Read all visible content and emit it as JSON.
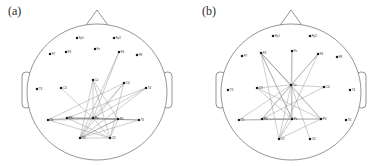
{
  "figure": {
    "background_color": "#ffffff",
    "outline_color": "#7a7a7a",
    "edge_color": "#909090",
    "node_color": "#1c1c1c"
  },
  "panels": [
    {
      "id": "a",
      "label": "(a)",
      "head": {
        "center_x": 97,
        "center_y": 92,
        "radius_x": 70,
        "radius_y": 68,
        "nose": [
          [
            84,
            28
          ],
          [
            97,
            10
          ],
          [
            110,
            28
          ]
        ],
        "ear_left": {
          "x": 22,
          "y": 72,
          "w": 9,
          "h": 36,
          "r": 4
        },
        "ear_right": {
          "x": 163,
          "y": 72,
          "w": 9,
          "h": 36,
          "r": 4
        }
      },
      "electrodes": [
        {
          "name": "Fp1",
          "x": 77,
          "y": 38
        },
        {
          "name": "Fp2",
          "x": 114,
          "y": 38
        },
        {
          "name": "F7",
          "x": 50,
          "y": 54
        },
        {
          "name": "F3",
          "x": 66,
          "y": 52
        },
        {
          "name": "Fz",
          "x": 95,
          "y": 49
        },
        {
          "name": "F4",
          "x": 119,
          "y": 52
        },
        {
          "name": "F8",
          "x": 137,
          "y": 55
        },
        {
          "name": "T3",
          "x": 37,
          "y": 89
        },
        {
          "name": "C3",
          "x": 61,
          "y": 88
        },
        {
          "name": "Cz",
          "x": 93,
          "y": 80
        },
        {
          "name": "C4",
          "x": 124,
          "y": 83
        },
        {
          "name": "T4",
          "x": 146,
          "y": 88
        },
        {
          "name": "T5",
          "x": 48,
          "y": 120
        },
        {
          "name": "P3",
          "x": 67,
          "y": 118
        },
        {
          "name": "Pz",
          "x": 93,
          "y": 118
        },
        {
          "name": "P4",
          "x": 118,
          "y": 119
        },
        {
          "name": "T6",
          "x": 139,
          "y": 120
        },
        {
          "name": "O1",
          "x": 80,
          "y": 138
        },
        {
          "name": "O2",
          "x": 110,
          "y": 138
        }
      ],
      "connections": [
        [
          "F4",
          "Pz"
        ],
        [
          "F4",
          "O1"
        ],
        [
          "Cz",
          "Pz"
        ],
        [
          "Cz",
          "O1"
        ],
        [
          "Cz",
          "P4"
        ],
        [
          "C4",
          "Pz"
        ],
        [
          "C4",
          "O1"
        ],
        [
          "C4",
          "T5"
        ],
        [
          "T4",
          "Pz"
        ],
        [
          "T4",
          "P3"
        ],
        [
          "T4",
          "O1"
        ],
        [
          "T5",
          "Pz"
        ],
        [
          "T5",
          "P4"
        ],
        [
          "T5",
          "O2"
        ],
        [
          "P3",
          "Pz"
        ],
        [
          "P3",
          "P4"
        ],
        [
          "P3",
          "O2"
        ],
        [
          "Pz",
          "P4"
        ],
        [
          "Pz",
          "O1"
        ],
        [
          "Pz",
          "O2"
        ],
        [
          "Pz",
          "T6"
        ],
        [
          "P4",
          "O1"
        ],
        [
          "P4",
          "O2"
        ],
        [
          "T6",
          "O1"
        ],
        [
          "T6",
          "P3"
        ],
        [
          "O1",
          "O2"
        ],
        [
          "O1",
          "P4"
        ],
        [
          "C3",
          "Pz"
        ],
        [
          "T5",
          "P3"
        ],
        [
          "P3",
          "T6"
        ],
        [
          "Cz",
          "O2"
        ],
        [
          "C4",
          "O2"
        ]
      ]
    },
    {
      "id": "b",
      "label": "(b)",
      "head": {
        "center_x": 97,
        "center_y": 92,
        "radius_x": 70,
        "radius_y": 68,
        "nose": [
          [
            84,
            28
          ],
          [
            97,
            10
          ],
          [
            110,
            28
          ]
        ],
        "ear_left": {
          "x": 22,
          "y": 72,
          "w": 9,
          "h": 36,
          "r": 4
        },
        "ear_right": {
          "x": 163,
          "y": 72,
          "w": 9,
          "h": 36,
          "r": 4
        }
      },
      "electrodes": [
        {
          "name": "Fp1",
          "x": 79,
          "y": 36
        },
        {
          "name": "Fp2",
          "x": 116,
          "y": 36
        },
        {
          "name": "F7",
          "x": 48,
          "y": 56
        },
        {
          "name": "F3",
          "x": 67,
          "y": 53
        },
        {
          "name": "Fz",
          "x": 98,
          "y": 51
        },
        {
          "name": "F4",
          "x": 124,
          "y": 54
        },
        {
          "name": "F8",
          "x": 143,
          "y": 57
        },
        {
          "name": "T3",
          "x": 34,
          "y": 90
        },
        {
          "name": "C3",
          "x": 63,
          "y": 88
        },
        {
          "name": "Cz",
          "x": 97,
          "y": 85
        },
        {
          "name": "C4",
          "x": 130,
          "y": 87
        },
        {
          "name": "T4",
          "x": 156,
          "y": 90
        },
        {
          "name": "T5",
          "x": 45,
          "y": 120
        },
        {
          "name": "P3",
          "x": 68,
          "y": 119
        },
        {
          "name": "Pz",
          "x": 98,
          "y": 119
        },
        {
          "name": "P4",
          "x": 127,
          "y": 119
        },
        {
          "name": "T6",
          "x": 152,
          "y": 120
        },
        {
          "name": "O1",
          "x": 85,
          "y": 139
        },
        {
          "name": "O2",
          "x": 116,
          "y": 139
        }
      ],
      "connections": [
        [
          "Fz",
          "Cz"
        ],
        [
          "Fz",
          "Pz"
        ],
        [
          "F3",
          "Cz"
        ],
        [
          "F3",
          "Pz"
        ],
        [
          "F3",
          "P4"
        ],
        [
          "F3",
          "O1"
        ],
        [
          "F4",
          "Cz"
        ],
        [
          "F4",
          "P3"
        ],
        [
          "F4",
          "O1"
        ],
        [
          "Cz",
          "T5"
        ],
        [
          "Cz",
          "P3"
        ],
        [
          "Cz",
          "Pz"
        ],
        [
          "Cz",
          "P4"
        ],
        [
          "Cz",
          "O1"
        ],
        [
          "Cz",
          "O2"
        ],
        [
          "Cz",
          "C3"
        ],
        [
          "Cz",
          "C4"
        ],
        [
          "C3",
          "P4"
        ],
        [
          "C3",
          "Pz"
        ],
        [
          "C4",
          "P3"
        ],
        [
          "T5",
          "P4"
        ],
        [
          "T5",
          "Pz"
        ],
        [
          "P3",
          "P4"
        ],
        [
          "P3",
          "Pz"
        ],
        [
          "Pz",
          "O1"
        ],
        [
          "P4",
          "O1"
        ],
        [
          "F3",
          "Pz"
        ],
        [
          "Cz",
          "F3"
        ]
      ]
    }
  ]
}
